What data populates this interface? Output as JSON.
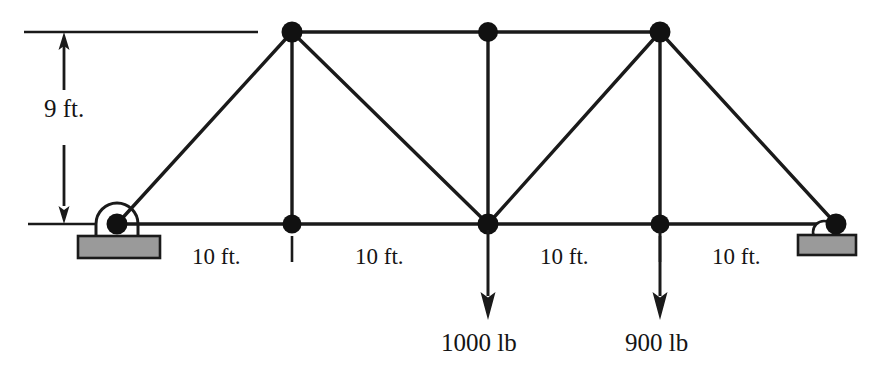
{
  "diagram": {
    "type": "statics-truss-free-body-diagram",
    "colors": {
      "member": "#1a1a1a",
      "node": "#111111",
      "support_plate_fill": "#9a9a9a",
      "support_plate_stroke": "#1a1a1a",
      "text": "#141414",
      "background": "#ffffff"
    }
  },
  "geometry": {
    "units": "ft",
    "span_total_ft": 40,
    "height_ft": 9,
    "bottom_chord_y_px": 224,
    "top_chord_y_px": 32,
    "nodes": [
      {
        "id": "A",
        "label": "left-support-pin",
        "x_px": 117,
        "y_px": 224,
        "chord": "bottom",
        "support": "pin"
      },
      {
        "id": "B",
        "label": "bottom-panel-1",
        "x_px": 292,
        "y_px": 224,
        "chord": "bottom",
        "support": "none"
      },
      {
        "id": "C",
        "label": "bottom-midspan",
        "x_px": 488,
        "y_px": 224,
        "chord": "bottom",
        "support": "none"
      },
      {
        "id": "D",
        "label": "bottom-panel-3",
        "x_px": 660,
        "y_px": 224,
        "chord": "bottom",
        "support": "none"
      },
      {
        "id": "E",
        "label": "right-support-roller",
        "x_px": 836,
        "y_px": 224,
        "chord": "bottom",
        "support": "roller"
      },
      {
        "id": "F",
        "label": "top-left",
        "x_px": 292,
        "y_px": 32,
        "chord": "top",
        "support": "none"
      },
      {
        "id": "G",
        "label": "top-center",
        "x_px": 488,
        "y_px": 32,
        "chord": "top",
        "support": "none"
      },
      {
        "id": "H",
        "label": "top-right",
        "x_px": 660,
        "y_px": 32,
        "chord": "top",
        "support": "none"
      }
    ],
    "members": [
      {
        "from": "A",
        "to": "B",
        "kind": "bottom-chord"
      },
      {
        "from": "B",
        "to": "C",
        "kind": "bottom-chord"
      },
      {
        "from": "C",
        "to": "D",
        "kind": "bottom-chord"
      },
      {
        "from": "D",
        "to": "E",
        "kind": "bottom-chord"
      },
      {
        "from": "F",
        "to": "G",
        "kind": "top-chord"
      },
      {
        "from": "G",
        "to": "H",
        "kind": "top-chord"
      },
      {
        "from": "A",
        "to": "F",
        "kind": "diagonal"
      },
      {
        "from": "F",
        "to": "C",
        "kind": "diagonal"
      },
      {
        "from": "C",
        "to": "H",
        "kind": "diagonal"
      },
      {
        "from": "H",
        "to": "E",
        "kind": "diagonal"
      },
      {
        "from": "B",
        "to": "F",
        "kind": "vertical"
      },
      {
        "from": "C",
        "to": "G",
        "kind": "vertical"
      },
      {
        "from": "D",
        "to": "H",
        "kind": "vertical"
      }
    ]
  },
  "dimensions": {
    "height": {
      "text": "9 ft.",
      "value": 9,
      "unit": "ft",
      "orientation": "vertical",
      "x_px": 64,
      "from_y_px": 32,
      "to_y_px": 224,
      "label_x_px": 44,
      "label_y_px": 108
    },
    "spans": [
      {
        "text": "10 ft.",
        "value": 10,
        "unit": "ft",
        "from_node": "A",
        "to_node": "B",
        "label_x_px": 192,
        "label_y_px": 245
      },
      {
        "text": "10 ft.",
        "value": 10,
        "unit": "ft",
        "from_node": "B",
        "to_node": "C",
        "label_x_px": 355,
        "label_y_px": 245
      },
      {
        "text": "10 ft.",
        "value": 10,
        "unit": "ft",
        "from_node": "C",
        "to_node": "D",
        "label_x_px": 540,
        "label_y_px": 245
      },
      {
        "text": "10 ft.",
        "value": 10,
        "unit": "ft",
        "from_node": "D",
        "to_node": "E",
        "label_x_px": 712,
        "label_y_px": 245
      }
    ]
  },
  "loads": [
    {
      "text": "1000 lb",
      "magnitude": 1000,
      "unit": "lb",
      "direction": "down",
      "at_node": "C",
      "arrow_x_px": 488,
      "arrow_from_y_px": 228,
      "arrow_to_y_px": 318,
      "label_x_px": 441,
      "label_y_px": 330
    },
    {
      "text": "900 lb",
      "magnitude": 900,
      "unit": "lb",
      "direction": "down",
      "at_node": "D",
      "arrow_x_px": 660,
      "arrow_from_y_px": 228,
      "arrow_to_y_px": 318,
      "label_x_px": 625,
      "label_y_px": 330
    }
  ],
  "supports": [
    {
      "kind": "pin",
      "at_node": "A",
      "icon": "pin-support-icon",
      "plate": {
        "x_px": 78,
        "y_px": 236,
        "w_px": 82,
        "h_px": 22
      }
    },
    {
      "kind": "roller",
      "at_node": "E",
      "icon": "roller-support-icon",
      "plate": {
        "x_px": 798,
        "y_px": 235,
        "w_px": 58,
        "h_px": 20
      }
    }
  ]
}
